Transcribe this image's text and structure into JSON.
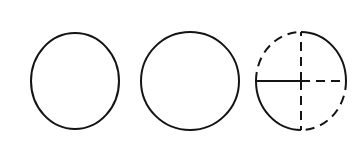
{
  "figure": {
    "background_color": "#ffffff",
    "stroke_color": "#141414",
    "canvas": {
      "width": 356,
      "height": 144
    }
  },
  "shapes": [
    {
      "id": "circle-1",
      "label": "Circle 1",
      "kind": "circle",
      "style": "solid",
      "center": {
        "x": 75,
        "y": 81
      },
      "radius_x": 44,
      "radius_y": 48,
      "stroke_width": 2.0,
      "stroke_color": "#141414"
    },
    {
      "id": "circle-2",
      "label": "Circle 2",
      "kind": "circle",
      "style": "solid",
      "center": {
        "x": 190,
        "y": 81
      },
      "radius_x": 49,
      "radius_y": 49,
      "stroke_width": 2.0,
      "stroke_color": "#141414"
    },
    {
      "id": "circle-3",
      "label": "Circle 3 (quartered)",
      "kind": "circle-quartered",
      "center": {
        "x": 301,
        "y": 81
      },
      "radius_x": 45,
      "radius_y": 49,
      "stroke_width": 2.0,
      "stroke_color": "#141414",
      "dash_pattern": "9 6",
      "arcs": [
        {
          "id": "arc-top-left",
          "label": "Top-left arc",
          "style": "dashed",
          "start_deg": 180,
          "end_deg": 270
        },
        {
          "id": "arc-top-right",
          "label": "Top-right arc",
          "style": "solid",
          "start_deg": 270,
          "end_deg": 360
        },
        {
          "id": "arc-bottom-right",
          "label": "Bottom-right arc",
          "style": "dashed",
          "start_deg": 0,
          "end_deg": 90
        },
        {
          "id": "arc-bottom-left",
          "label": "Bottom-left arc",
          "style": "solid",
          "start_deg": 90,
          "end_deg": 180
        }
      ],
      "radii": [
        {
          "id": "radius-left",
          "label": "Left horizontal radius",
          "style": "solid",
          "direction": "west"
        },
        {
          "id": "radius-right",
          "label": "Right horizontal radius",
          "style": "dashed",
          "direction": "east"
        },
        {
          "id": "radius-up",
          "label": "Upper vertical radius",
          "style": "dashed",
          "direction": "north"
        },
        {
          "id": "radius-down",
          "label": "Lower vertical radius",
          "style": "dashed",
          "direction": "south"
        }
      ]
    }
  ]
}
